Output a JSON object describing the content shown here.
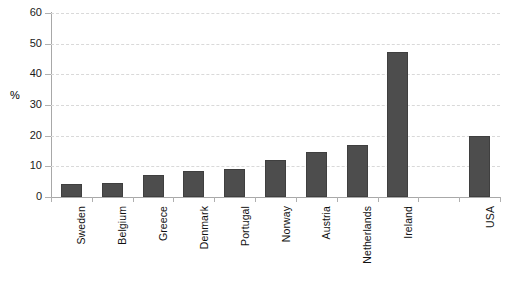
{
  "chart_data": {
    "type": "bar",
    "title": "",
    "subtitle": "",
    "xlabel": "",
    "ylabel": "%",
    "categories": [
      "Sweden",
      "Belgium",
      "Greece",
      "Denmark",
      "Portugal",
      "Norway",
      "Austria",
      "Netherlands",
      "Ireland",
      "",
      "USA"
    ],
    "values": [
      4.3,
      4.6,
      7.1,
      8.6,
      9.2,
      12.1,
      14.8,
      17.0,
      47.4,
      null,
      20.0
    ],
    "series": [
      {
        "name": "%",
        "values": [
          4.3,
          4.6,
          7.1,
          8.6,
          9.2,
          12.1,
          14.8,
          17.0,
          47.4,
          null,
          20.0
        ]
      }
    ],
    "ylim": [
      0,
      60
    ],
    "yticks": [
      0,
      10,
      20,
      30,
      40,
      50,
      60
    ],
    "ytick_labels": [
      "0",
      "10",
      "20",
      "30",
      "40",
      "50",
      "60"
    ],
    "grid": "horizontal-dashed",
    "legend": "none",
    "bar_color": "#4d4d4d",
    "grid_color": "#d9d9d9",
    "axis_color": "#a8a8a8"
  }
}
